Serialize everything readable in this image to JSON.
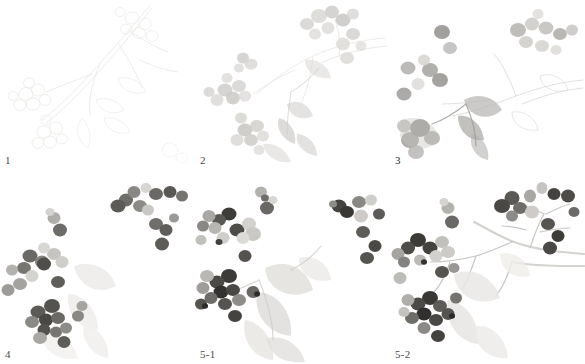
{
  "figure": {
    "medium": "ink-and-wash",
    "background_color": "#ffffff",
    "panel_count": 6,
    "grid": "3 columns x 2 rows"
  },
  "panels": [
    {
      "id": "panel-1",
      "label": "1",
      "stage_description": "faint pencil underdrawing of branch, leaf and berry outlines",
      "tone": "very-light",
      "x": 0,
      "y": 0,
      "w": 195,
      "h": 170
    },
    {
      "id": "panel-2",
      "label": "2",
      "stage_description": "first pale gray washes blocking in berry clusters and leaves",
      "tone": "light",
      "x": 195,
      "y": 0,
      "w": 195,
      "h": 170
    },
    {
      "id": "panel-3",
      "label": "3",
      "stage_description": "mid-tone gray applied to selected berries and foliage shadows",
      "tone": "medium-light",
      "x": 390,
      "y": 0,
      "w": 195,
      "h": 170
    },
    {
      "id": "panel-4",
      "label": "4",
      "stage_description": "berries deepened with darker gray, form and volume established",
      "tone": "medium-dark",
      "x": 0,
      "y": 170,
      "w": 195,
      "h": 194
    },
    {
      "id": "panel-5-1",
      "label": "5-1",
      "stage_description": "leaves added with soft gray wash, berries at near-final darkness",
      "tone": "dark",
      "x": 195,
      "y": 170,
      "w": 195,
      "h": 194
    },
    {
      "id": "panel-5-2",
      "label": "5-2",
      "stage_description": "finished study with branch, stems, leaves and fully rendered berries",
      "tone": "dark",
      "x": 390,
      "y": 170,
      "w": 195,
      "h": 194
    }
  ],
  "palette": {
    "background": "#ffffff",
    "faint_pencil": "#e3e1de",
    "pale_wash": "#d6d4d1",
    "light_gray": "#c2c0bd",
    "mid_gray": "#999795",
    "dark_gray": "#6e6c6a",
    "darkest_gray": "#3f3e3d",
    "label_text": "#4a4a4a"
  }
}
